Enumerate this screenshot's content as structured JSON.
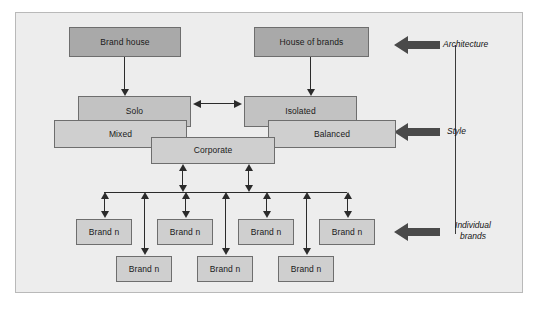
{
  "diagram": {
    "frame": {
      "background": "#ededed",
      "border_color": "#b9b9b9"
    },
    "colors": {
      "box_dark": "#a9a9a9",
      "box_mid": "#c2c2c2",
      "box_light": "#cfcfcf",
      "box_border": "#6e6e6e",
      "connector": "#2b2b2b",
      "fat_arrow": "#4a4a4a",
      "text": "#1a1a1a"
    },
    "levels": {
      "architecture": {
        "label": "Architecture",
        "boxes": [
          {
            "label": "Brand house"
          },
          {
            "label": "House of brands"
          }
        ]
      },
      "style": {
        "label": "Style",
        "boxes": [
          {
            "label": "Solo"
          },
          {
            "label": "Isolated"
          },
          {
            "label": "Mixed"
          },
          {
            "label": "Balanced"
          },
          {
            "label": "Corporate"
          }
        ]
      },
      "individual_brands": {
        "label": "Individual\nbrands",
        "label_line1": "Individual",
        "label_line2": "brands",
        "upper_row": [
          {
            "label": "Brand n"
          },
          {
            "label": "Brand n"
          },
          {
            "label": "Brand n"
          },
          {
            "label": "Brand n"
          }
        ],
        "lower_row": [
          {
            "label": "Brand n"
          },
          {
            "label": "Brand n"
          },
          {
            "label": "Brand n"
          }
        ]
      }
    }
  }
}
